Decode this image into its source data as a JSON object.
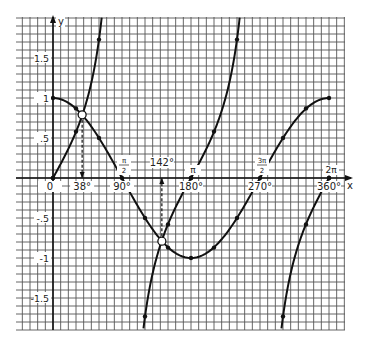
{
  "chart_data": {
    "type": "line",
    "title": "",
    "xlabel": "x",
    "ylabel": "y",
    "xlim": [
      -48,
      380
    ],
    "ylim": [
      -1.9,
      2.0
    ],
    "grid": true,
    "x_ticks": [
      {
        "deg": 0,
        "label": "0"
      },
      {
        "deg": 38,
        "label": "38°"
      },
      {
        "deg": 90,
        "label": "90°",
        "pi_label": "π/2"
      },
      {
        "deg": 142,
        "label": "142°"
      },
      {
        "deg": 180,
        "label": "180°",
        "pi_label": "π"
      },
      {
        "deg": 270,
        "label": "270°",
        "pi_label": "3π/2"
      },
      {
        "deg": 360,
        "label": "360°",
        "pi_label": "2π"
      }
    ],
    "y_ticks": [
      {
        "value": 1.5,
        "label": "1.5"
      },
      {
        "value": 1,
        "label": "1"
      },
      {
        "value": 0.5,
        "label": ".5"
      },
      {
        "value": -0.5,
        "label": "-.5"
      },
      {
        "value": -1,
        "label": "-1"
      },
      {
        "value": -1.5,
        "label": "-1.5"
      }
    ],
    "series": [
      {
        "name": "cos x",
        "x": [
          0,
          30,
          60,
          90,
          120,
          150,
          180,
          210,
          240,
          270,
          300,
          330,
          360
        ],
        "values": [
          1,
          0.87,
          0.5,
          0,
          -0.5,
          -0.87,
          -1,
          -0.87,
          -0.5,
          0,
          0.5,
          0.87,
          1
        ]
      },
      {
        "name": "tan x",
        "branches": [
          {
            "x": [
              0,
              30,
              60
            ],
            "values": [
              0,
              0.58,
              1.73
            ]
          },
          {
            "x": [
              120,
              150,
              180,
              210,
              240
            ],
            "values": [
              -1.73,
              -0.58,
              0,
              0.58,
              1.73
            ]
          },
          {
            "x": [
              300,
              330,
              360
            ],
            "values": [
              -1.73,
              -0.58,
              0
            ]
          }
        ]
      }
    ],
    "intersections": [
      {
        "deg": 38,
        "value": 0.79
      },
      {
        "deg": 142,
        "value": -0.79
      }
    ],
    "annotations": [
      "38°",
      "142°"
    ]
  }
}
